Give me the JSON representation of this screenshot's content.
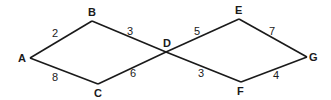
{
  "diagram": {
    "type": "weighted-graph",
    "nodes": [
      {
        "id": "A",
        "label": "A",
        "x": 30,
        "y": 58,
        "lx": 18,
        "ly": 62
      },
      {
        "id": "B",
        "label": "B",
        "x": 92,
        "y": 21,
        "lx": 88,
        "ly": 16
      },
      {
        "id": "C",
        "label": "C",
        "x": 98,
        "y": 84,
        "lx": 94,
        "ly": 97
      },
      {
        "id": "D",
        "label": "D",
        "x": 166,
        "y": 52,
        "lx": 163,
        "ly": 47
      },
      {
        "id": "E",
        "label": "E",
        "x": 239,
        "y": 19,
        "lx": 235,
        "ly": 14
      },
      {
        "id": "F",
        "label": "F",
        "x": 241,
        "y": 82,
        "lx": 237,
        "ly": 95
      },
      {
        "id": "G",
        "label": "G",
        "x": 307,
        "y": 57,
        "lx": 309,
        "ly": 61
      }
    ],
    "edges": [
      {
        "from": "A",
        "to": "B",
        "weight": "2",
        "wx": 55,
        "wy": 37
      },
      {
        "from": "B",
        "to": "D",
        "weight": "3",
        "wx": 130,
        "wy": 35
      },
      {
        "from": "A",
        "to": "C",
        "weight": "8",
        "wx": 55,
        "wy": 81
      },
      {
        "from": "C",
        "to": "D",
        "weight": "6",
        "wx": 133,
        "wy": 77
      },
      {
        "from": "D",
        "to": "E",
        "weight": "5",
        "wx": 197,
        "wy": 35
      },
      {
        "from": "E",
        "to": "G",
        "weight": "7",
        "wx": 272,
        "wy": 35
      },
      {
        "from": "D",
        "to": "F",
        "weight": "3",
        "wx": 201,
        "wy": 77
      },
      {
        "from": "F",
        "to": "G",
        "weight": "4",
        "wx": 276,
        "wy": 79
      }
    ]
  }
}
